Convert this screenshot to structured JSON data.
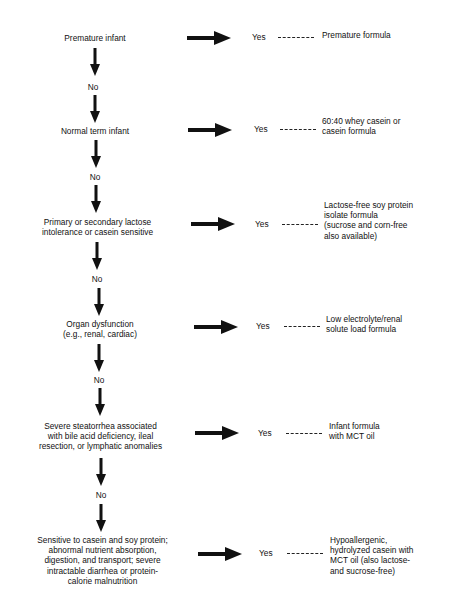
{
  "flowchart": {
    "steps": [
      {
        "condition": "Premature infant",
        "yes_label": "Yes",
        "result": "Premature formula",
        "no_label": "No"
      },
      {
        "condition": "Normal term infant",
        "yes_label": "Yes",
        "result": "60:40 whey casein or\ncasein formula",
        "no_label": "No"
      },
      {
        "condition": "Primary or secondary lactose\nintolerance or casein sensitive",
        "yes_label": "Yes",
        "result": "Lactose-free soy protein\nisolate formula\n(sucrose and corn-free\nalso available)",
        "no_label": "No"
      },
      {
        "condition": "Organ dysfunction\n(e.g., renal, cardiac)",
        "yes_label": "Yes",
        "result": "Low electrolyte/renal\nsolute load formula",
        "no_label": "No"
      },
      {
        "condition": "Severe steatorrhea associated\nwith bile acid deficiency, ileal\nresection, or lymphatic anomalies",
        "yes_label": "Yes",
        "result": "Infant formula\nwith MCT oil",
        "no_label": "No"
      },
      {
        "condition": "Sensitive to casein and soy protein;\nabnormal nutrient absorption,\ndigestion, and transport; severe\nintractable diarrhea or protein-\ncalorie malnutrition",
        "yes_label": "Yes",
        "result": "Hypoallergenic,\nhydrolyzed casein with\nMCT oil (also lactose-\nand sucrose-free)"
      }
    ]
  }
}
